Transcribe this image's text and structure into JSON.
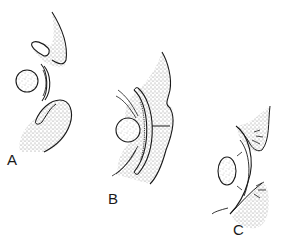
{
  "figure": {
    "panels": [
      {
        "id": "A",
        "label": "A"
      },
      {
        "id": "B",
        "label": "B"
      },
      {
        "id": "C",
        "label": "C"
      }
    ],
    "colors": {
      "ink": "#1a1a1a",
      "stipple": "#777777",
      "background": "#ffffff"
    }
  }
}
